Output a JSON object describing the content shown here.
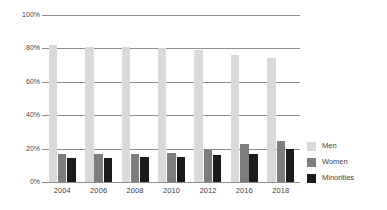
{
  "chart_data": {
    "type": "bar",
    "title": "",
    "subtitle": "",
    "xlabel": "",
    "ylabel": "",
    "categories": [
      "2004",
      "2006",
      "2008",
      "2010",
      "2012",
      "2016",
      "2018"
    ],
    "series": [
      {
        "name": "Men",
        "color": "#d9d9d9",
        "values": [
          82,
          81,
          81,
          80.5,
          79,
          76,
          74
        ]
      },
      {
        "name": "Women",
        "color": "#7d7d7d",
        "values": [
          16.5,
          16.5,
          17,
          17.5,
          19,
          22.5,
          24.5
        ]
      },
      {
        "name": "Minorities",
        "color": "#1b1b1b",
        "values": [
          14.5,
          14.5,
          15,
          15,
          16,
          17,
          19.5
        ]
      }
    ],
    "ylim": [
      0,
      100
    ],
    "ytick_values": [
      0,
      20,
      40,
      60,
      80,
      100
    ],
    "ytick_labels": [
      "0%",
      "20%",
      "40%",
      "60%",
      "80%",
      "100%"
    ],
    "grid": true,
    "grid_axis": "y",
    "legend_position": "right",
    "legend": [
      {
        "label": "Men",
        "color": "#d9d9d9"
      },
      {
        "label": "Women",
        "color": "#7d7d7d"
      },
      {
        "label": "Minorities",
        "color": "#1b1b1b"
      }
    ],
    "axis_color": "#8d8d8d",
    "text_color": "#3f3f3f",
    "background": "#ffffff"
  }
}
